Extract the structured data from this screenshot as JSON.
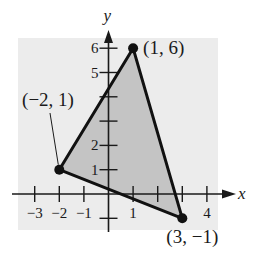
{
  "chart_data": {
    "type": "scatter",
    "title": "",
    "xlabel": "x",
    "ylabel": "y",
    "xlim": [
      -3.6,
      4.4
    ],
    "ylim": [
      -1.5,
      6.5
    ],
    "grid": false,
    "background_panel_color": "#ececec",
    "fill_color": "#c4c4c4",
    "line_color": "#111111",
    "x_ticks": [
      -3,
      -2,
      -1,
      1,
      2,
      3,
      4
    ],
    "x_tick_labels": [
      "−3",
      "−2",
      "−1",
      "1",
      "4"
    ],
    "x_tick_label_values": [
      -3,
      -2,
      -1,
      1,
      4
    ],
    "y_ticks": [
      -1,
      1,
      2,
      3,
      4,
      5,
      6
    ],
    "y_tick_labels": [
      "1",
      "2",
      "5",
      "6"
    ],
    "y_tick_label_values": [
      1,
      2,
      5,
      6
    ],
    "series": [
      {
        "name": "triangle",
        "shape": "polygon",
        "filled": true,
        "points": [
          {
            "x": 1,
            "y": 6,
            "label": "(1, 6)"
          },
          {
            "x": -2,
            "y": 1,
            "label": "(−2, 1)"
          },
          {
            "x": 3,
            "y": -1,
            "label": "(3, −1)"
          }
        ]
      }
    ]
  }
}
